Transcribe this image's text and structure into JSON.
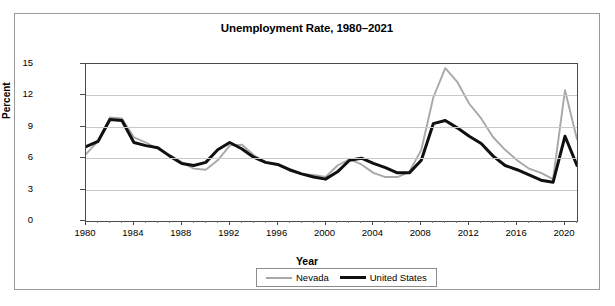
{
  "chart_data": {
    "type": "line",
    "title": "Unemployment Rate, 1980–2021",
    "xlabel": "Year",
    "ylabel": "Percent",
    "ylim": [
      0,
      15
    ],
    "xlim": [
      1980,
      2021
    ],
    "yticks": [
      0,
      3,
      6,
      9,
      12,
      15
    ],
    "xticks": [
      1980,
      1984,
      1988,
      1992,
      1996,
      2000,
      2004,
      2008,
      2012,
      2016,
      2020
    ],
    "grid": true,
    "legend_position": "bottom-center",
    "x": [
      1980,
      1981,
      1982,
      1983,
      1984,
      1985,
      1986,
      1987,
      1988,
      1989,
      1990,
      1991,
      1992,
      1993,
      1994,
      1995,
      1996,
      1997,
      1998,
      1999,
      2000,
      2001,
      2002,
      2003,
      2004,
      2005,
      2006,
      2007,
      2008,
      2009,
      2010,
      2011,
      2012,
      2013,
      2014,
      2015,
      2016,
      2017,
      2018,
      2019,
      2020,
      2021
    ],
    "series": [
      {
        "name": "Nevada",
        "color": "#a8a8a8",
        "values": [
          6.4,
          7.6,
          9.9,
          9.8,
          8.0,
          7.5,
          6.9,
          6.3,
          5.6,
          5.0,
          4.9,
          5.8,
          7.2,
          7.3,
          6.3,
          5.6,
          5.4,
          4.8,
          4.5,
          4.4,
          4.2,
          5.3,
          5.9,
          5.4,
          4.6,
          4.2,
          4.2,
          4.7,
          6.8,
          11.8,
          14.6,
          13.3,
          11.2,
          9.8,
          8.0,
          6.8,
          5.8,
          5.0,
          4.6,
          4.0,
          12.5,
          7.8
        ]
      },
      {
        "name": "United States",
        "color": "#101010",
        "values": [
          7.1,
          7.6,
          9.7,
          9.6,
          7.5,
          7.2,
          7.0,
          6.2,
          5.5,
          5.3,
          5.6,
          6.8,
          7.5,
          6.9,
          6.1,
          5.6,
          5.4,
          4.9,
          4.5,
          4.2,
          4.0,
          4.7,
          5.8,
          6.0,
          5.5,
          5.1,
          4.6,
          4.6,
          5.8,
          9.3,
          9.6,
          8.9,
          8.1,
          7.4,
          6.2,
          5.3,
          4.9,
          4.4,
          3.9,
          3.7,
          8.1,
          5.3
        ]
      }
    ]
  },
  "legend": {
    "items": [
      {
        "label": "Nevada"
      },
      {
        "label": "United States"
      }
    ]
  }
}
